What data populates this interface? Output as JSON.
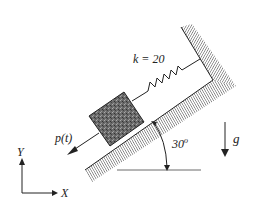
{
  "diagram": {
    "title": "",
    "spring_label": "k = 20",
    "force_label": "p(t)",
    "angle_label": "30",
    "angle_unit": "o",
    "gravity_label": "g",
    "axis_y_label": "Y",
    "axis_x_label": "X",
    "colors": {
      "line": "#222222",
      "block": "#6e6e6e",
      "hatch": "#555555",
      "background": "#ffffff"
    }
  }
}
